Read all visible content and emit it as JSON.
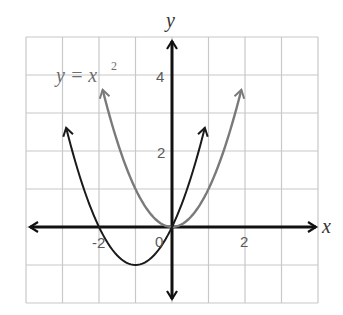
{
  "chart_data": {
    "type": "line",
    "title": "",
    "xlabel": "x",
    "ylabel": "y",
    "xlim": [
      -4,
      4
    ],
    "ylim": [
      -2,
      5
    ],
    "grid": true,
    "x_ticks_labeled": [
      {
        "value": -2,
        "label": "-2"
      },
      {
        "value": 0,
        "label": "0"
      },
      {
        "value": 2,
        "label": "2"
      }
    ],
    "y_ticks_labeled": [
      {
        "value": 2,
        "label": "2"
      },
      {
        "value": 4,
        "label": "4"
      }
    ],
    "series": [
      {
        "name": "y = x^2",
        "label_text": "y = x",
        "label_superscript": "2",
        "color": "#7a7a7a",
        "x_range": [
          -1.9,
          1.9
        ],
        "x": [
          -1.9,
          -1.5,
          -1,
          -0.5,
          0,
          0.5,
          1,
          1.5,
          1.9
        ],
        "y": [
          3.61,
          2.25,
          1,
          0.25,
          0,
          0.25,
          1,
          2.25,
          3.61
        ],
        "arrows_at_ends": true
      },
      {
        "name": "shifted parabola",
        "color": "#1a1a1a",
        "x_range": [
          -2.9,
          0.9
        ],
        "x": [
          -2.9,
          -2.5,
          -2,
          -1.5,
          -1,
          -0.5,
          0,
          0.5,
          0.9
        ],
        "y": [
          2.61,
          1.25,
          0,
          -0.75,
          -1,
          -0.75,
          0,
          1.25,
          2.61
        ],
        "arrows_at_ends": true
      }
    ],
    "annotations": [
      {
        "text": "y = x²",
        "x": -3.2,
        "y": 3.8
      }
    ]
  },
  "labels": {
    "x_axis": "x",
    "y_axis": "y",
    "curve_main": "y = x",
    "curve_main_sup": "2",
    "tick_x_neg2": "-2",
    "tick_x_0": "0",
    "tick_x_2": "2",
    "tick_y_2": "2",
    "tick_y_4": "4"
  },
  "colors": {
    "grid": "#c8c8c8",
    "axes": "#111111",
    "curve_gray": "#7a7a7a",
    "curve_black": "#1a1a1a"
  }
}
